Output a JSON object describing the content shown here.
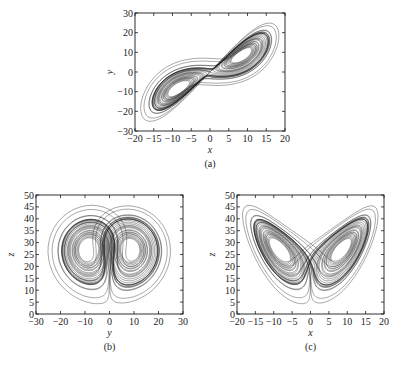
{
  "figure": {
    "background": "#ffffff",
    "ink_color": "#1a1a1a"
  },
  "chart_data": [
    {
      "type": "line",
      "id": "a",
      "caption": "(a)",
      "title": "",
      "xlabel": "x",
      "ylabel": "y",
      "xlim": [
        -20,
        20
      ],
      "ylim": [
        -30,
        30
      ],
      "xticks": [
        -20,
        -15,
        -10,
        -5,
        0,
        5,
        10,
        15,
        20
      ],
      "yticks": [
        -30,
        -20,
        -10,
        0,
        10,
        20,
        30
      ],
      "xtick_labels": [
        "−20",
        "−15",
        "−10",
        "−5",
        "0",
        "5",
        "10",
        "15",
        "20"
      ],
      "ytick_labels": [
        "−30",
        "−20",
        "−10",
        "0",
        "10",
        "20",
        "30"
      ],
      "grid": false,
      "series": [
        {
          "name": "Lorenz attractor x–y projection",
          "projection": [
            "x",
            "y"
          ]
        }
      ],
      "annotations": [
        "fixed points near (-8.5,-8.5) and (8.5,8.5)"
      ],
      "box": {
        "left": 135,
        "top": 13,
        "right": 285,
        "bottom": 131
      }
    },
    {
      "type": "line",
      "id": "b",
      "caption": "(b)",
      "title": "",
      "xlabel": "y",
      "ylabel": "z",
      "xlim": [
        -30,
        30
      ],
      "ylim": [
        0,
        50
      ],
      "xticks": [
        -30,
        -20,
        -10,
        0,
        10,
        20,
        30
      ],
      "yticks": [
        0,
        5,
        10,
        15,
        20,
        25,
        30,
        35,
        40,
        45,
        50
      ],
      "xtick_labels": [
        "−30",
        "−20",
        "−10",
        "0",
        "10",
        "20",
        "30"
      ],
      "ytick_labels": [
        "0",
        "5",
        "10",
        "15",
        "20",
        "25",
        "30",
        "35",
        "40",
        "45",
        "50"
      ],
      "grid": false,
      "series": [
        {
          "name": "Lorenz attractor y–z projection",
          "projection": [
            "y",
            "z"
          ]
        }
      ],
      "box": {
        "left": 36,
        "top": 195,
        "right": 183,
        "bottom": 314
      }
    },
    {
      "type": "line",
      "id": "c",
      "caption": "(c)",
      "title": "",
      "xlabel": "x",
      "ylabel": "z",
      "xlim": [
        -20,
        20
      ],
      "ylim": [
        0,
        50
      ],
      "xticks": [
        -20,
        -15,
        -10,
        -5,
        0,
        5,
        10,
        15,
        20
      ],
      "yticks": [
        0,
        5,
        10,
        15,
        20,
        25,
        30,
        35,
        40,
        45,
        50
      ],
      "xtick_labels": [
        "−20",
        "−15",
        "−10",
        "−5",
        "0",
        "5",
        "10",
        "15",
        "20"
      ],
      "ytick_labels": [
        "0",
        "5",
        "10",
        "15",
        "20",
        "25",
        "30",
        "35",
        "40",
        "45",
        "50"
      ],
      "grid": false,
      "series": [
        {
          "name": "Lorenz attractor x–z projection",
          "projection": [
            "x",
            "z"
          ]
        }
      ],
      "box": {
        "left": 237,
        "top": 195,
        "right": 384,
        "bottom": 314
      }
    }
  ],
  "simulation": {
    "sigma": 10,
    "rho": 28,
    "beta": 2.6667,
    "initial": [
      1,
      1,
      20
    ],
    "dt": 0.008,
    "steps": 5200
  }
}
